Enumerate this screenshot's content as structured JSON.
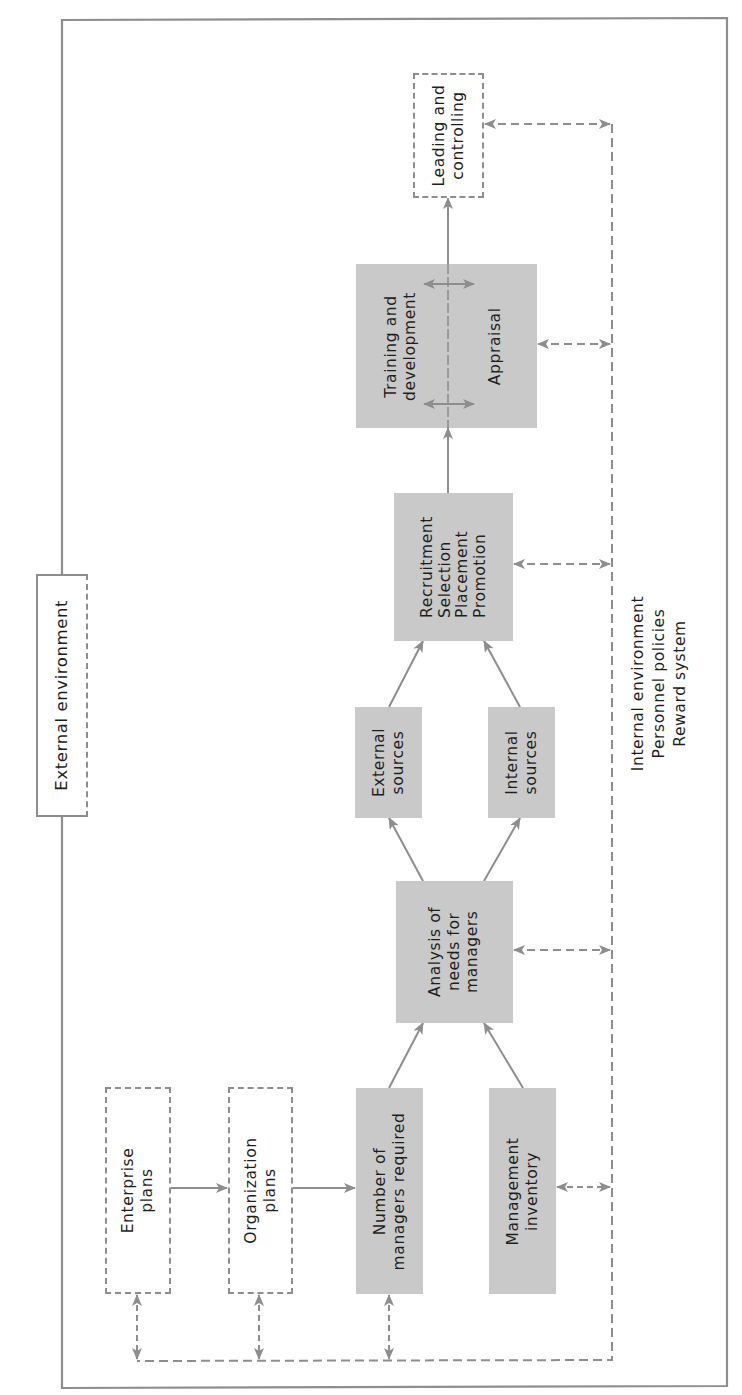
{
  "diagram": {
    "colors": {
      "box_fill": "#c9c9c9",
      "line": "#8e8e8e",
      "text": "#1e1e1e",
      "background": "#ffffff"
    },
    "outer_boundary_label": [
      "External environment"
    ],
    "internal_environment_label": [
      "Internal environment",
      "Personnel policies",
      "Reward system"
    ],
    "nodes": {
      "enterprise_plans": {
        "lines": [
          "Enterprise",
          "plans"
        ],
        "style": "dashed"
      },
      "organization_plans": {
        "lines": [
          "Organization",
          "plans"
        ],
        "style": "dashed"
      },
      "number_of_managers": {
        "lines": [
          "Number of",
          "managers required"
        ],
        "style": "shaded"
      },
      "management_inventory": {
        "lines": [
          "Management",
          "inventory"
        ],
        "style": "shaded"
      },
      "analysis_of_needs": {
        "lines": [
          "Analysis of",
          "needs for",
          "managers"
        ],
        "style": "shaded"
      },
      "external_sources": {
        "lines": [
          "External",
          "sources"
        ],
        "style": "shaded"
      },
      "internal_sources": {
        "lines": [
          "Internal",
          "sources"
        ],
        "style": "shaded"
      },
      "recruitment": {
        "lines": [
          "Recruitment",
          "Selection",
          "Placement",
          "Promotion"
        ],
        "style": "shaded"
      },
      "training_appraisal": {
        "lines_left": [
          "Training and",
          "development"
        ],
        "lines_right": [
          "Appraisal"
        ],
        "style": "shaded"
      },
      "leading_controlling": {
        "lines": [
          "Leading and",
          "controlling"
        ],
        "style": "dashed"
      }
    },
    "edges": [
      {
        "from": "enterprise_plans",
        "to": "organization_plans",
        "type": "solid-arrow"
      },
      {
        "from": "organization_plans",
        "to": "number_of_managers",
        "type": "solid-arrow"
      },
      {
        "from": "number_of_managers",
        "to": "analysis_of_needs",
        "type": "solid-arrow"
      },
      {
        "from": "management_inventory",
        "to": "analysis_of_needs",
        "type": "solid-arrow"
      },
      {
        "from": "analysis_of_needs",
        "to": "external_sources",
        "type": "solid-arrow"
      },
      {
        "from": "analysis_of_needs",
        "to": "internal_sources",
        "type": "solid-arrow"
      },
      {
        "from": "external_sources",
        "to": "recruitment",
        "type": "solid-arrow"
      },
      {
        "from": "internal_sources",
        "to": "recruitment",
        "type": "solid-arrow"
      },
      {
        "from": "recruitment",
        "to": "training_appraisal",
        "type": "solid-arrow"
      },
      {
        "from": "training_appraisal",
        "to": "leading_controlling",
        "type": "solid-arrow"
      },
      {
        "from": "training_and_development",
        "to": "appraisal",
        "type": "dashed-double-arrow"
      },
      {
        "from": "enterprise_plans",
        "to": "internal_environment",
        "type": "dashed-double-arrow"
      },
      {
        "from": "organization_plans",
        "to": "internal_environment",
        "type": "dashed-double-arrow"
      },
      {
        "from": "number_of_managers",
        "to": "internal_environment",
        "type": "dashed-double-arrow"
      },
      {
        "from": "management_inventory",
        "to": "internal_environment",
        "type": "dashed-double-arrow"
      },
      {
        "from": "analysis_of_needs",
        "to": "internal_environment",
        "type": "dashed-double-arrow"
      },
      {
        "from": "recruitment",
        "to": "internal_environment",
        "type": "dashed-double-arrow"
      },
      {
        "from": "training_appraisal",
        "to": "internal_environment",
        "type": "dashed-double-arrow"
      },
      {
        "from": "leading_controlling",
        "to": "internal_environment",
        "type": "dashed-double-arrow"
      }
    ]
  }
}
